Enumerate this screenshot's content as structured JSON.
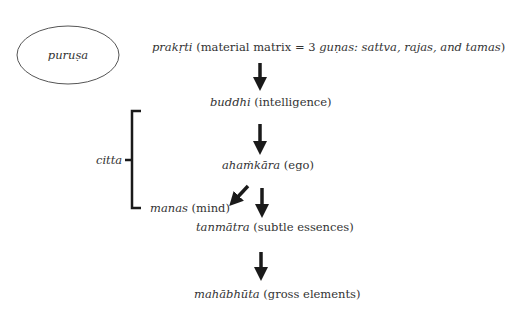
{
  "diagram": {
    "purusa": {
      "label": "puruṣa"
    },
    "nodes": [
      {
        "id": "prakrti",
        "term": "prakṛti",
        "gloss_open": " (material matrix = 3 ",
        "gunas_term": "guṇas: sattva, rajas, and tamas",
        "gloss_close": ")"
      },
      {
        "id": "buddhi",
        "term": "buddhi",
        "gloss": " (intelligence)"
      },
      {
        "id": "ahamkara",
        "term": "ahaṁkāra",
        "gloss": " (ego)"
      },
      {
        "id": "manas",
        "term": "manas",
        "gloss": " (mind)"
      },
      {
        "id": "tanmatra",
        "term": "tanmātra",
        "gloss": " (subtle essences)"
      },
      {
        "id": "mahabhuta",
        "term": "mahābhūta",
        "gloss": " (gross elements)"
      }
    ],
    "bracket": {
      "label": "citta",
      "spans": [
        "buddhi",
        "ahamkara",
        "manas"
      ]
    },
    "edges": [
      {
        "from": "prakrti",
        "to": "buddhi"
      },
      {
        "from": "buddhi",
        "to": "ahamkara"
      },
      {
        "from": "ahamkara",
        "to": "manas"
      },
      {
        "from": "ahamkara",
        "to": "tanmatra"
      },
      {
        "from": "tanmatra",
        "to": "mahabhuta"
      }
    ],
    "colors": {
      "text": "#333333",
      "arrow": "#1a1a1a",
      "ellipse_stroke": "#555555"
    }
  }
}
